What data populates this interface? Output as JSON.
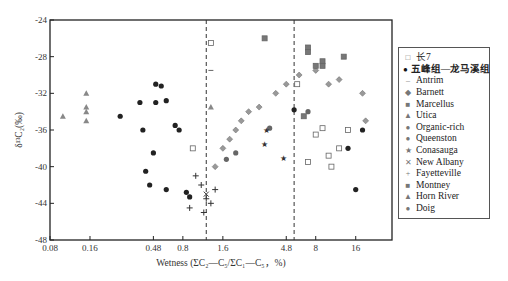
{
  "chart_data": {
    "type": "scatter",
    "title": "",
    "xlabel": "Wetness (ΣC2—C5/ΣC1—C5，%)",
    "ylabel": "δ13C2(‰)",
    "xscale": "log",
    "xlim": [
      0.08,
      30
    ],
    "ylim": [
      -48,
      -24
    ],
    "x_ticks": [
      "0.08",
      "0.16",
      "0.48",
      "0.8",
      "1.6",
      "4.8",
      "8",
      "16"
    ],
    "y_ticks": [
      "-24",
      "-28",
      "-32",
      "-36",
      "-40",
      "-44",
      "-48"
    ],
    "reference_lines": [
      {
        "x": 1.2,
        "style": "dashed"
      },
      {
        "x": 5.5,
        "style": "dashed"
      }
    ],
    "legend_position": "right",
    "series": [
      {
        "name": "长7",
        "marker": "open-square",
        "points": [
          [
            1.3,
            -26.5
          ],
          [
            5.8,
            -31
          ],
          [
            9,
            -35.8
          ],
          [
            14,
            -36
          ],
          [
            8,
            -36.5
          ],
          [
            10,
            -38.8
          ],
          [
            12,
            -38
          ],
          [
            7,
            -39.5
          ],
          [
            10.5,
            -40
          ],
          [
            0.95,
            -38
          ]
        ]
      },
      {
        "name": "五峰组—龙马溪组",
        "marker": "filled-circle",
        "points": [
          [
            0.27,
            -34.5
          ],
          [
            0.38,
            -33
          ],
          [
            0.4,
            -36
          ],
          [
            0.5,
            -31
          ],
          [
            0.55,
            -31.2
          ],
          [
            0.5,
            -33
          ],
          [
            0.6,
            -32.8
          ],
          [
            0.7,
            -35.5
          ],
          [
            0.75,
            -36
          ],
          [
            0.48,
            -38.5
          ],
          [
            0.42,
            -40.5
          ],
          [
            0.45,
            -42
          ],
          [
            0.6,
            -42.5
          ],
          [
            5.5,
            -33.8
          ],
          [
            14,
            -38
          ],
          [
            16,
            -42.5
          ],
          [
            18,
            -36
          ]
        ]
      },
      {
        "name": "Antrim",
        "marker": "dash",
        "points": [
          [
            1.3,
            -29.5
          ]
        ]
      },
      {
        "name": "Barnett",
        "marker": "diamond",
        "points": [
          [
            1.6,
            -38
          ],
          [
            2,
            -36
          ],
          [
            2.5,
            -34
          ],
          [
            3,
            -33.5
          ],
          [
            4,
            -32
          ],
          [
            4.8,
            -31
          ],
          [
            1.4,
            -40
          ],
          [
            1.8,
            -37
          ],
          [
            2.2,
            -35
          ],
          [
            6,
            -30
          ],
          [
            8,
            -29.5
          ],
          [
            10,
            -31
          ],
          [
            12,
            -30.5
          ],
          [
            18,
            -32
          ],
          [
            19,
            -35
          ]
        ]
      },
      {
        "name": "Marcellus",
        "marker": "filled-square",
        "points": [
          [
            3.3,
            -26
          ],
          [
            7,
            -27
          ],
          [
            8,
            -29
          ],
          [
            9,
            -28.5
          ],
          [
            6.5,
            -34.5
          ]
        ]
      },
      {
        "name": "Utica",
        "marker": "triangle",
        "points": [
          [
            1.3,
            -33.5
          ]
        ]
      },
      {
        "name": "Organic-rich",
        "marker": "circle",
        "points": [
          [
            1.7,
            -39.2
          ],
          [
            2,
            -38.5
          ]
        ]
      },
      {
        "name": "Queenston",
        "marker": "circle",
        "points": [
          [
            3.6,
            -35.8
          ],
          [
            7,
            -34
          ]
        ]
      },
      {
        "name": "Conasauga",
        "marker": "star",
        "points": [
          [
            3.4,
            -36
          ],
          [
            3.3,
            -37.5
          ],
          [
            4.6,
            -39
          ]
        ]
      },
      {
        "name": "New Albany",
        "marker": "x",
        "points": [
          [
            1.2,
            -43
          ]
        ]
      },
      {
        "name": "Fayetteville",
        "marker": "plus",
        "points": [
          [
            1,
            -41
          ],
          [
            1.1,
            -42
          ],
          [
            1.2,
            -43.5
          ],
          [
            1.3,
            -44
          ],
          [
            1.4,
            -42.5
          ],
          [
            0.9,
            -44.5
          ],
          [
            1.15,
            -45
          ]
        ]
      },
      {
        "name": "Montney",
        "marker": "filled-square",
        "points": [
          [
            7,
            -27.5
          ],
          [
            9,
            -29
          ],
          [
            13,
            -28
          ]
        ]
      },
      {
        "name": "Horn River",
        "marker": "triangle",
        "points": [
          [
            0.1,
            -34.5
          ],
          [
            0.15,
            -32
          ],
          [
            0.15,
            -34
          ],
          [
            0.15,
            -35
          ],
          [
            0.15,
            -33.5
          ]
        ]
      },
      {
        "name": "Doig",
        "marker": "filled-circle",
        "points": [
          [
            0.85,
            -42.8
          ],
          [
            0.9,
            -43.3
          ]
        ]
      }
    ]
  },
  "legend": {
    "items": [
      {
        "label": "长7",
        "symbol": "□"
      },
      {
        "label": "五峰组—龙马溪组",
        "symbol": "●"
      },
      {
        "label": "Antrim",
        "symbol": "–"
      },
      {
        "label": "Barnett",
        "symbol": "◆"
      },
      {
        "label": "Marcellus",
        "symbol": "■"
      },
      {
        "label": "Utica",
        "symbol": "▲"
      },
      {
        "label": "Organic-rich",
        "symbol": "●"
      },
      {
        "label": "Queenston",
        "symbol": "●"
      },
      {
        "label": "Conasauga",
        "symbol": "★"
      },
      {
        "label": "New Albany",
        "symbol": "✕"
      },
      {
        "label": "Fayetteville",
        "symbol": "+"
      },
      {
        "label": "Montney",
        "symbol": "■"
      },
      {
        "label": "Horn River",
        "symbol": "▲"
      },
      {
        "label": "Doig",
        "symbol": "●"
      }
    ]
  },
  "axes": {
    "xlabel": "Wetness (ΣC₂—C₅/ΣC₁—C₅，%)",
    "ylabel": "δ¹³C₂(‰)"
  }
}
